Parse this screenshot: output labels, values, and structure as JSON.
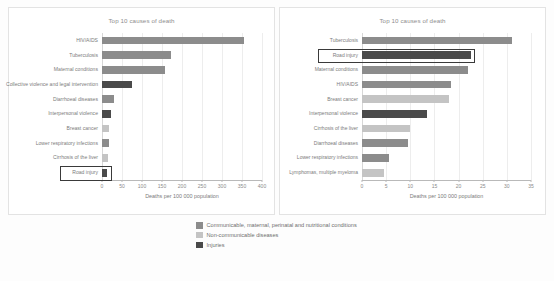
{
  "figure": {
    "xlabel": "Deaths per 100 000 population"
  },
  "legend": {
    "items": [
      {
        "label": "Communicable, maternal, perinatal and nutritional conditions",
        "color": "#8c8c8c"
      },
      {
        "label": "Non-communicable diseases",
        "color": "#c4c4c4"
      },
      {
        "label": "Injuries",
        "color": "#4a4a4a"
      }
    ]
  },
  "colors": {
    "communicable": "#8c8c8c",
    "noncommunicable": "#c4c4c4",
    "injuries": "#4a4a4a",
    "highlight_border": "#3a3a3a",
    "gridline": "#ededed",
    "axis": "#b9b9b9",
    "text": "#7b7b7b",
    "panel_bg": "#ffffff",
    "page_bg": "#fdfdfd"
  },
  "chart_data": [
    {
      "type": "bar",
      "orientation": "horizontal",
      "title": "Top 10 causes of death",
      "xlabel": "Deaths per 100 000 population",
      "ylabel": "",
      "xlim": [
        0,
        400
      ],
      "xticks": [
        0,
        50,
        100,
        150,
        200,
        250,
        300,
        350,
        400
      ],
      "grid": true,
      "legend_position": "below-figure",
      "highlighted_category": "Road injury",
      "categories": [
        "HIV/AIDS",
        "Tuberculosis",
        "Maternal conditions",
        "Collective violence and legal intervention",
        "Diarrhoeal diseases",
        "Interpersonal violence",
        "Breast cancer",
        "Lower respiratory infections",
        "Cirrhosis of the liver",
        "Road injury"
      ],
      "values": [
        355,
        172,
        158,
        75,
        31,
        23,
        18,
        18,
        14,
        13
      ],
      "groups": [
        "Communicable, maternal, perinatal and nutritional conditions",
        "Communicable, maternal, perinatal and nutritional conditions",
        "Communicable, maternal, perinatal and nutritional conditions",
        "Injuries",
        "Communicable, maternal, perinatal and nutritional conditions",
        "Injuries",
        "Non-communicable diseases",
        "Communicable, maternal, perinatal and nutritional conditions",
        "Non-communicable diseases",
        "Injuries"
      ]
    },
    {
      "type": "bar",
      "orientation": "horizontal",
      "title": "Top 10 causes of death",
      "xlabel": "Deaths per 100 000 population",
      "ylabel": "",
      "xlim": [
        0,
        35
      ],
      "xticks": [
        0,
        5,
        10,
        15,
        20,
        25,
        30,
        35
      ],
      "grid": true,
      "legend_position": "below-figure",
      "highlighted_category": "Road injury",
      "categories": [
        "Tuberculosis",
        "Road injury",
        "Maternal conditions",
        "HIV/AIDS",
        "Breast cancer",
        "Interpersonal violence",
        "Cirrhosis of the liver",
        "Diarrhoeal diseases",
        "Lower respiratory infections",
        "Lymphomas, multiple myeloma"
      ],
      "values": [
        31.0,
        22.5,
        22.0,
        18.5,
        18.0,
        13.5,
        10.0,
        9.5,
        5.5,
        4.5
      ],
      "groups": [
        "Communicable, maternal, perinatal and nutritional conditions",
        "Injuries",
        "Communicable, maternal, perinatal and nutritional conditions",
        "Communicable, maternal, perinatal and nutritional conditions",
        "Non-communicable diseases",
        "Injuries",
        "Non-communicable diseases",
        "Communicable, maternal, perinatal and nutritional conditions",
        "Communicable, maternal, perinatal and nutritional conditions",
        "Non-communicable diseases"
      ]
    }
  ]
}
